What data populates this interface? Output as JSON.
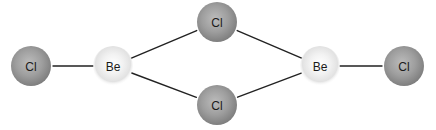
{
  "diagram": {
    "title": "",
    "colors": {
      "background": "#ffffff",
      "bond": "#222222",
      "cl_center": "#b4b4b4",
      "cl_edge": "#7a7a7a",
      "be_center": "#ffffff",
      "be_edge": "#d8d8d8",
      "label": "#1a1a1a"
    },
    "atoms": [
      {
        "id": "cl-left",
        "element": "Cl",
        "label": "Cl",
        "x": 31,
        "y": 66,
        "r": 20,
        "role": "terminal"
      },
      {
        "id": "be-left",
        "element": "Be",
        "label": "Be",
        "x": 113,
        "y": 66,
        "r": 18,
        "role": "center"
      },
      {
        "id": "cl-top",
        "element": "Cl",
        "label": "Cl",
        "x": 217,
        "y": 22,
        "r": 20,
        "role": "bridging"
      },
      {
        "id": "cl-bottom",
        "element": "Cl",
        "label": "Cl",
        "x": 217,
        "y": 105,
        "r": 20,
        "role": "bridging"
      },
      {
        "id": "be-right",
        "element": "Be",
        "label": "Be",
        "x": 320,
        "y": 66,
        "r": 18,
        "role": "center"
      },
      {
        "id": "cl-right",
        "element": "Cl",
        "label": "Cl",
        "x": 404,
        "y": 66,
        "r": 20,
        "role": "terminal"
      }
    ],
    "bonds": [
      {
        "from": "cl-left",
        "to": "be-left"
      },
      {
        "from": "be-left",
        "to": "cl-top"
      },
      {
        "from": "be-left",
        "to": "cl-bottom"
      },
      {
        "from": "cl-top",
        "to": "be-right"
      },
      {
        "from": "cl-bottom",
        "to": "be-right"
      },
      {
        "from": "be-right",
        "to": "cl-right"
      }
    ]
  }
}
